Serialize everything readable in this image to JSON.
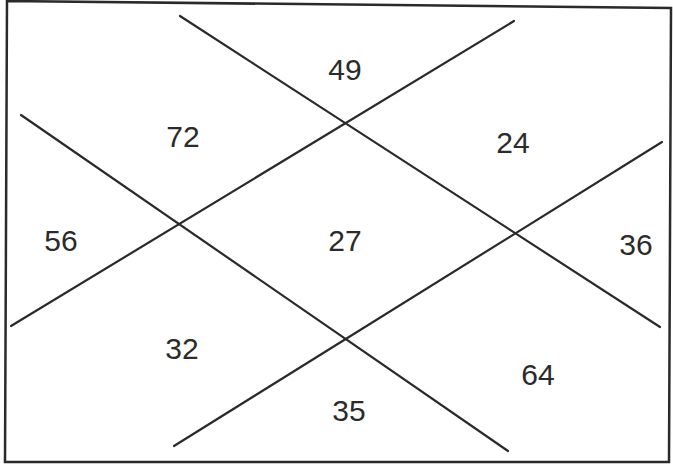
{
  "puzzle": {
    "type": "number-regions-diagram",
    "frame": {
      "corners": [
        [
          7,
          1
        ],
        [
          671,
          8
        ],
        [
          669,
          462
        ],
        [
          5,
          462
        ]
      ],
      "stroke_color": "#2a2a2a"
    },
    "lines": [
      {
        "id": "line-1",
        "from": [
          180,
          16
        ],
        "to": [
          660,
          327
        ]
      },
      {
        "id": "line-2",
        "from": [
          514,
          21
        ],
        "to": [
          11,
          326
        ]
      },
      {
        "id": "line-3",
        "from": [
          21,
          115
        ],
        "to": [
          508,
          451
        ]
      },
      {
        "id": "line-4",
        "from": [
          662,
          142
        ],
        "to": [
          174,
          446
        ]
      }
    ],
    "regions": [
      {
        "id": "top",
        "value": "49",
        "x": 345,
        "y": 70
      },
      {
        "id": "upper-left",
        "value": "72",
        "x": 183,
        "y": 137
      },
      {
        "id": "upper-right",
        "value": "24",
        "x": 513,
        "y": 143
      },
      {
        "id": "left",
        "value": "56",
        "x": 61,
        "y": 241
      },
      {
        "id": "center",
        "value": "27",
        "x": 345,
        "y": 241
      },
      {
        "id": "right",
        "value": "36",
        "x": 636,
        "y": 245
      },
      {
        "id": "lower-left",
        "value": "32",
        "x": 182,
        "y": 349
      },
      {
        "id": "lower-right",
        "value": "64",
        "x": 538,
        "y": 375
      },
      {
        "id": "bottom",
        "value": "35",
        "x": 349,
        "y": 411
      }
    ],
    "line_color": "#2a2a2a",
    "text_color": "#2b2b2b"
  }
}
